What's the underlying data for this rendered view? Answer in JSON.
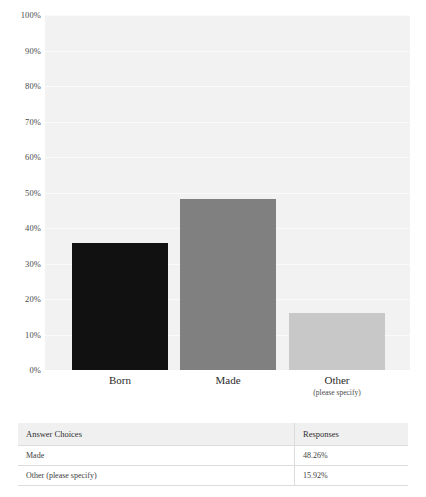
{
  "chart_data": {
    "type": "bar",
    "title": "",
    "xlabel": "",
    "ylabel": "",
    "categories": [
      "Born",
      "Made",
      "Other"
    ],
    "category_sublabels": [
      "",
      "",
      "(please specify)"
    ],
    "values": [
      35.82,
      48.26,
      15.92
    ],
    "ylim": [
      0,
      100
    ],
    "ytick_labels": [
      "100%",
      "90%",
      "80%",
      "70%",
      "60%",
      "50%",
      "40%",
      "30%",
      "20%",
      "10%",
      "0%"
    ],
    "ytick_values": [
      100,
      90,
      80,
      70,
      60,
      50,
      40,
      30,
      20,
      10,
      0
    ],
    "grid": true,
    "legend": "none",
    "series_colors": [
      "#111111",
      "#808080",
      "#c8c8c8"
    ],
    "plot_background": "#f2f2f2"
  },
  "table": {
    "headers": [
      "Answer Choices",
      "Responses"
    ],
    "rows": [
      {
        "choice": "Made",
        "responses": "48.26%"
      },
      {
        "choice": "Other (please specify)",
        "responses": "15.92%"
      }
    ]
  }
}
